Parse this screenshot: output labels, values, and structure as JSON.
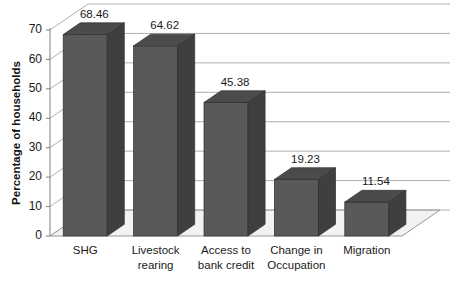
{
  "chart_data": {
    "type": "bar",
    "title": "",
    "subtitle": "",
    "xlabel": "",
    "ylabel": "Percentage of households",
    "categories": [
      "SHG",
      "Livestock rearing",
      "Access to bank credit",
      "Change in Occupation",
      "Migration"
    ],
    "category_lines": [
      [
        "SHG"
      ],
      [
        "Livestock",
        "rearing"
      ],
      [
        "Access to",
        "bank credit"
      ],
      [
        "Change in",
        "Occupation"
      ],
      [
        "Migration"
      ]
    ],
    "values": [
      68.46,
      64.62,
      45.38,
      19.23,
      11.54
    ],
    "value_labels": [
      "68.46",
      "64.62",
      "45.38",
      "19.23",
      "11.54"
    ],
    "ylim": [
      0,
      70
    ],
    "ytick_values": [
      0,
      10,
      20,
      30,
      40,
      50,
      60,
      70
    ],
    "ytick_labels": [
      "0",
      "10",
      "20",
      "30",
      "40",
      "50",
      "60",
      "70"
    ],
    "grid": true,
    "grid_axis": "y",
    "legend": false,
    "legend_position": "none",
    "style": "3d-column",
    "colors": {
      "bar_front": "#595959",
      "bar_side": "#3f3f3f",
      "bar_top": "#4b4b4b",
      "bar_outline": "#2e2e2e",
      "grid": "#a6a6a6",
      "axis": "#808080",
      "floor": "#f2f2f2",
      "wall": "#ffffff",
      "text": "#1a1a1a",
      "background": "#ffffff"
    }
  },
  "axes": {
    "y_axis_title": "Percentage of households"
  }
}
